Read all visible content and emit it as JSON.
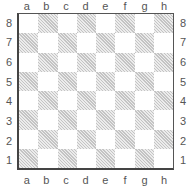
{
  "board": {
    "files": [
      "a",
      "b",
      "c",
      "d",
      "e",
      "f",
      "g",
      "h"
    ],
    "ranks": [
      "8",
      "7",
      "6",
      "5",
      "4",
      "3",
      "2",
      "1"
    ],
    "light_square_color": "#ffffff",
    "dark_square_color": "#d0d0d0",
    "dark_square_style": "diagonal-hatch",
    "pieces": []
  }
}
